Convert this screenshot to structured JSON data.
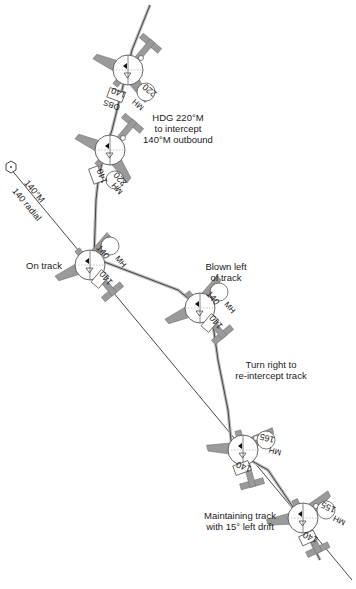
{
  "diagram": {
    "type": "vor_track_interception",
    "colors": {
      "track_line": "#333333",
      "flight_path": "#555555",
      "aircraft_fill": "#9a9a9a",
      "aircraft_stroke": "#666666",
      "instrument_face": "#ffffff",
      "text": "#222222"
    },
    "station": {
      "icon": "vor-hexagon-icon"
    },
    "radial_label": {
      "line1": "140°M",
      "line2": "140 radial"
    },
    "annotations": {
      "intercept": {
        "line1": "HDG 220°M",
        "line2": "to intercept",
        "line3": "140°M outbound"
      },
      "on_track": "On track",
      "blown_left": {
        "line1": "Blown left",
        "line2": "of track"
      },
      "turn_right": {
        "line1": "Turn right to",
        "line2": "re-intercept track"
      },
      "maintaining": {
        "line1": "Maintaining track",
        "line2": "with 15° left drift"
      }
    },
    "aircraft": [
      {
        "id": "a1",
        "obs": "140",
        "mh": "220",
        "obs_label": "OBS",
        "mh_label": "MH"
      },
      {
        "id": "a2",
        "obs": "140",
        "mh": "220",
        "mh_label": "MH"
      },
      {
        "id": "a3",
        "obs": "140",
        "mh": "140",
        "mh_label": "MH"
      },
      {
        "id": "a4",
        "obs": "140",
        "mh": "140",
        "mh_label": "MH"
      },
      {
        "id": "a5",
        "obs": "140",
        "mh": "165",
        "mh_label": "MH"
      },
      {
        "id": "a6",
        "obs": "140",
        "mh": "155",
        "mh_label": "MH"
      }
    ]
  }
}
